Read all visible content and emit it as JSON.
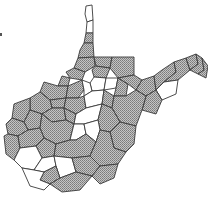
{
  "map": {
    "region": "West Virginia",
    "unit": "county",
    "legend_classes": [
      {
        "key": "shaded",
        "fill_pattern": "crosshatch",
        "color": "#a8a8a8"
      },
      {
        "key": "unshaded",
        "color": "#ffffff"
      }
    ],
    "stroke_color": "#3a3a3a",
    "counties": [
      {
        "id": "hancock",
        "class": "unshaded",
        "points": "86,6 92,5 93,20 87,22 85,14"
      },
      {
        "id": "brooke",
        "class": "unshaded",
        "points": "87,22 93,20 93,33 86,33"
      },
      {
        "id": "ohio",
        "class": "shaded",
        "points": "86,33 93,33 93,43 84,43"
      },
      {
        "id": "marshall",
        "class": "shaded",
        "points": "84,43 93,43 94,57 78,58 80,50"
      },
      {
        "id": "wetzel",
        "class": "shaded",
        "points": "78,58 94,57 95,66 85,72 74,68"
      },
      {
        "id": "monongalia",
        "class": "shaded",
        "points": "94,57 112,57 110,68 96,66"
      },
      {
        "id": "preston",
        "class": "shaded",
        "points": "112,57 134,57 134,75 118,78 110,68"
      },
      {
        "id": "tyler",
        "class": "shaded",
        "points": "74,68 85,72 82,80 70,78 66,72"
      },
      {
        "id": "marion",
        "class": "shaded",
        "points": "95,66 110,68 106,78 94,77 92,70"
      },
      {
        "id": "harrison",
        "class": "unshaded",
        "points": "94,77 106,78 104,90 92,91 90,83"
      },
      {
        "id": "taylor",
        "class": "unshaded",
        "points": "106,78 118,78 116,88 104,90"
      },
      {
        "id": "barbour",
        "class": "shaded",
        "points": "116,88 118,78 128,84 126,96 114,96"
      },
      {
        "id": "tucker",
        "class": "shaded",
        "points": "118,78 134,75 142,80 136,90 128,84"
      },
      {
        "id": "grant",
        "class": "shaded",
        "points": "142,80 154,76 156,90 146,96 136,90"
      },
      {
        "id": "mineral",
        "class": "shaded",
        "points": "154,76 162,70 174,62 176,72 164,82 156,90"
      },
      {
        "id": "hampshire",
        "class": "shaded",
        "points": "174,62 186,58 190,70 178,80 164,82 176,72"
      },
      {
        "id": "morgan",
        "class": "shaded",
        "points": "186,58 196,54 198,64 190,70"
      },
      {
        "id": "berkeley",
        "class": "shaded",
        "points": "196,54 202,58 204,70 198,74 190,70 198,64"
      },
      {
        "id": "jefferson",
        "class": "shaded",
        "points": "202,58 208,66 206,78 198,74 204,70"
      },
      {
        "id": "hardy",
        "class": "unshaded",
        "points": "164,82 178,80 176,94 162,100 156,90"
      },
      {
        "id": "pendleton",
        "class": "shaded",
        "points": "146,96 156,90 162,100 156,114 142,110"
      },
      {
        "id": "pleasants",
        "class": "shaded",
        "points": "62,76 70,78 68,86 58,86"
      },
      {
        "id": "wood",
        "class": "shaded",
        "points": "44,82 58,86 68,86 66,98 50,100 40,92"
      },
      {
        "id": "ritchie",
        "class": "shaded",
        "points": "68,86 82,80 84,90 78,98 66,98"
      },
      {
        "id": "doddridge",
        "class": "unshaded",
        "points": "82,80 90,83 92,91 84,96 84,90"
      },
      {
        "id": "wirt",
        "class": "shaded",
        "points": "50,100 66,98 64,108 52,108"
      },
      {
        "id": "gilmer",
        "class": "shaded",
        "points": "66,98 78,98 84,96 86,108 76,114 64,108"
      },
      {
        "id": "lewis",
        "class": "unshaded",
        "points": "84,96 92,91 104,90 102,104 86,108"
      },
      {
        "id": "upshur",
        "class": "shaded",
        "points": "104,90 114,96 112,108 102,104"
      },
      {
        "id": "randolph",
        "class": "shaded",
        "points": "114,96 126,96 136,90 146,96 142,110 136,126 120,122 112,108"
      },
      {
        "id": "jackson",
        "class": "shaded",
        "points": "30,98 40,92 50,100 52,108 42,114 30,110"
      },
      {
        "id": "roane",
        "class": "shaded",
        "points": "52,108 64,108 66,120 52,122 42,114"
      },
      {
        "id": "calhoun",
        "class": "shaded",
        "points": "64,108 76,114 74,124 66,120"
      },
      {
        "id": "braxton",
        "class": "unshaded",
        "points": "76,114 86,108 102,104 98,120 84,124 74,124"
      },
      {
        "id": "webster",
        "class": "shaded",
        "points": "98,120 102,104 112,108 120,122 110,132 100,130"
      },
      {
        "id": "mason",
        "class": "shaded",
        "points": "14,104 30,98 30,110 24,122 12,118"
      },
      {
        "id": "putnam",
        "class": "shaded",
        "points": "24,122 30,110 42,114 40,128 28,130"
      },
      {
        "id": "kanawha",
        "class": "shaded",
        "points": "40,128 42,114 52,122 66,120 74,124 70,140 56,144 44,138"
      },
      {
        "id": "clay",
        "class": "unshaded",
        "points": "74,124 84,124 86,134 76,140 70,140"
      },
      {
        "id": "nicholas",
        "class": "unshaded",
        "points": "84,124 98,120 100,130 96,142 86,134"
      },
      {
        "id": "pocahontas",
        "class": "shaded",
        "points": "110,132 120,122 136,126 134,144 126,152 114,148"
      },
      {
        "id": "cabell",
        "class": "shaded",
        "points": "6,124 12,118 24,122 28,130 18,136 8,134"
      },
      {
        "id": "wayne",
        "class": "shaded",
        "points": "4,136 8,134 18,136 20,148 14,160 6,154"
      },
      {
        "id": "lincoln",
        "class": "shaded",
        "points": "18,136 28,130 40,128 44,138 36,146 20,148"
      },
      {
        "id": "boone",
        "class": "shaded",
        "points": "36,146 44,138 56,144 54,156 42,158"
      },
      {
        "id": "fayette",
        "class": "shaded",
        "points": "56,144 70,140 76,140 86,134 96,142 90,156 72,158 54,156"
      },
      {
        "id": "greenbrier",
        "class": "shaded",
        "points": "96,142 100,130 110,132 114,148 126,152 118,164 100,166 90,156"
      },
      {
        "id": "mingo",
        "class": "unshaded",
        "points": "14,160 20,148 36,146 42,158 34,170 22,168"
      },
      {
        "id": "logan",
        "class": "unshaded",
        "points": "42,158 54,156 56,166 44,172 34,170"
      },
      {
        "id": "raleigh",
        "class": "unshaded",
        "points": "54,156 72,158 76,172 60,178 56,166"
      },
      {
        "id": "summers",
        "class": "shaded",
        "points": "72,158 90,156 100,166 92,176 76,172"
      },
      {
        "id": "monroe",
        "class": "shaded",
        "points": "92,176 100,166 118,164 114,178 100,184"
      },
      {
        "id": "wyoming",
        "class": "shaded",
        "points": "44,172 56,166 60,178 50,184 40,180"
      },
      {
        "id": "mcdowell",
        "class": "unshaded",
        "points": "22,168 34,170 44,172 40,180 50,184 44,190 30,186"
      },
      {
        "id": "mercer",
        "class": "shaded",
        "points": "50,184 60,178 76,172 92,176 80,190 62,192"
      }
    ],
    "marker": {
      "label": "",
      "present": true
    }
  }
}
